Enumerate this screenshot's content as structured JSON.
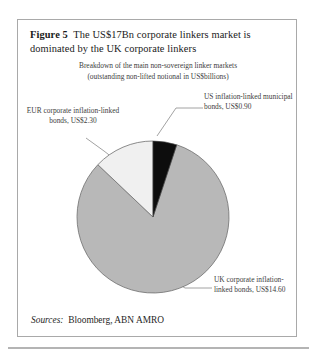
{
  "figure": {
    "label": "Figure 5",
    "title": "The US$17Bn corporate linkers market is dominated by the UK corporate linkers",
    "subtitle_line1": "Breakdown of the main non-sovereign linker markets",
    "subtitle_line2": "(outstanding non-lifted notional in US$billions)",
    "sources_label": "Sources:",
    "sources_value": "Bloomberg, ABN AMRO"
  },
  "labels": {
    "us": "US inflation-linked municipal bonds, US$0.90",
    "eur": "EUR corporate inflation-linked bonds, US$2.30",
    "uk": "UK corporate inflation-linked bonds, US$14.60"
  },
  "colors": {
    "uk_slice": "#b8b8b8",
    "eur_slice": "#f0f0f0",
    "us_slice": "#0d0d0d",
    "slice_outline": "#6e6e6e",
    "frame_border": "#a9a9a9",
    "leader_line": "#8a8a8a",
    "text": "#3d3d3d",
    "title_text": "#1a1a1a"
  },
  "chart_data": {
    "type": "pie",
    "title": "Breakdown of the main non-sovereign linker markets",
    "subtitle": "(outstanding non-lifted notional in US$billions)",
    "unit": "US$billions",
    "total": 17.8,
    "categories": [
      "US inflation-linked municipal bonds",
      "UK corporate inflation-linked bonds",
      "EUR corporate inflation-linked bonds"
    ],
    "values": [
      0.9,
      14.6,
      2.3
    ],
    "slices": [
      {
        "name": "US inflation-linked municipal bonds",
        "value": 0.9,
        "value_label": "US$0.90",
        "percent": 5.1,
        "color": "#0d0d0d",
        "start_angle_deg": 0,
        "end_angle_deg": 18.2
      },
      {
        "name": "UK corporate inflation-linked bonds",
        "value": 14.6,
        "value_label": "US$14.60",
        "percent": 82.0,
        "color": "#b8b8b8",
        "start_angle_deg": 18.2,
        "end_angle_deg": 313.5
      },
      {
        "name": "EUR corporate inflation-linked bonds",
        "value": 2.3,
        "value_label": "US$2.30",
        "percent": 12.9,
        "color": "#f0f0f0",
        "start_angle_deg": 313.5,
        "end_angle_deg": 360
      }
    ],
    "legend": "callout-labels",
    "grid": false,
    "xlabel": "",
    "ylabel": ""
  }
}
